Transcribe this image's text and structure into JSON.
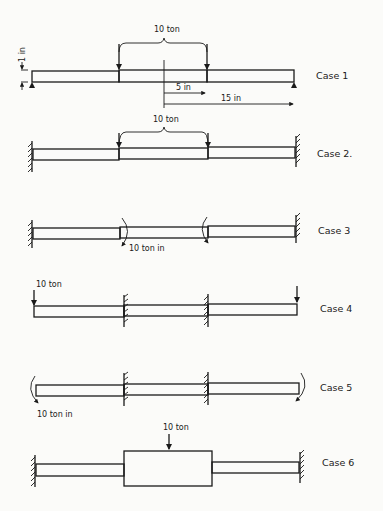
{
  "figure": {
    "background": "#fbfbf9",
    "ink": "#1a1a1a",
    "cases": [
      {
        "id": "case1",
        "label": "Case 1",
        "load_label": "10 ton",
        "thickness_label": "1 in",
        "dim_inner_label": "5 in",
        "dim_outer_label": "15 in",
        "supports": "simple supports at both ends",
        "loading": "two point loads at ends of central section"
      },
      {
        "id": "case2",
        "label": "Case 2.",
        "load_label": "10 ton",
        "supports": "fixed walls at both ends",
        "loading": "two point loads at ends of central section"
      },
      {
        "id": "case3",
        "label": "Case 3",
        "load_label": "10 ton in",
        "supports": "fixed walls at both ends",
        "loading": "opposing moments at ends of central section"
      },
      {
        "id": "case4",
        "label": "Case 4",
        "load_label": "10 ton",
        "supports": "fixed at ends of central section",
        "loading": "point loads at free ends"
      },
      {
        "id": "case5",
        "label": "Case 5",
        "load_label": "10 ton in",
        "supports": "fixed at ends of central section",
        "loading": "moments at free ends"
      },
      {
        "id": "case6",
        "label": "Case 6",
        "load_label": "10 ton",
        "supports": "fixed walls at both ends",
        "loading": "central point load on thick block"
      }
    ]
  }
}
